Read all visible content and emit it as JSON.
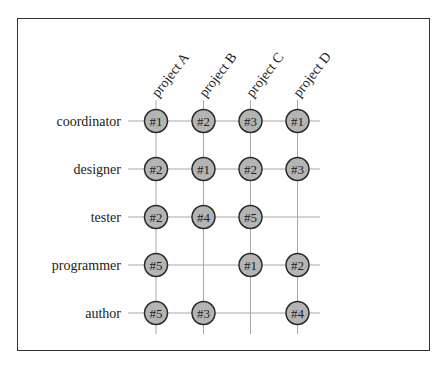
{
  "diagram": {
    "type": "assignment-matrix",
    "columns": [
      "project A",
      "project B",
      "project C",
      "project D"
    ],
    "rows": [
      "coordinator",
      "designer",
      "tester",
      "programmer",
      "author"
    ],
    "cells": [
      [
        "#1",
        "#2",
        "#3",
        "#1"
      ],
      [
        "#2",
        "#1",
        "#2",
        "#3"
      ],
      [
        "#2",
        "#4",
        "#5",
        null
      ],
      [
        "#5",
        null,
        "#1",
        "#2"
      ],
      [
        "#5",
        "#3",
        null,
        "#4"
      ]
    ],
    "colors": {
      "node_fill": "#b4b4b4",
      "node_stroke": "#2a2a2a",
      "grid": "#a8a8a8"
    }
  }
}
